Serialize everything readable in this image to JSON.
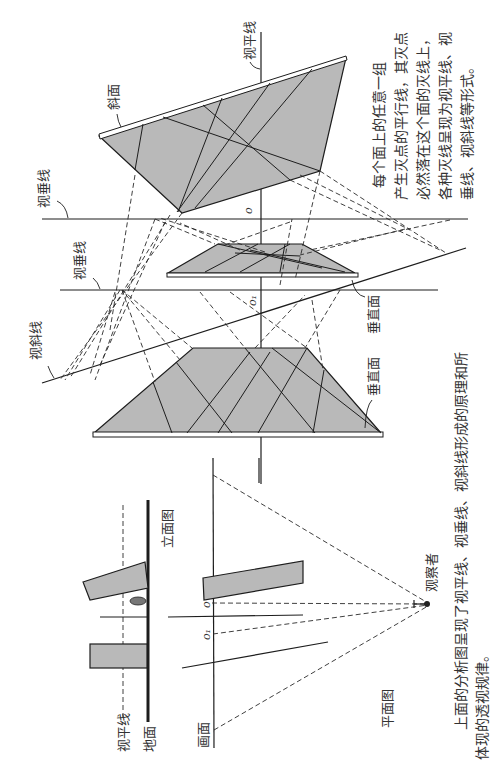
{
  "orientation": "rotated-90-ccw",
  "labels": {
    "horizon_line": "视平线",
    "vertical_line_top": "视垂线",
    "vertical_line_middle": "视垂线",
    "oblique_line": "视斜线",
    "inclined_plane": "斜面",
    "vertical_plane_middle": "垂直面",
    "vertical_plane_bottom": "垂直面",
    "point_o": "o",
    "point_o1": "o₁"
  },
  "plan_elevation": {
    "elevation_title": "立面图",
    "plan_title": "平面图",
    "horizon_line": "视平线",
    "ground": "地面",
    "picture_plane": "画面",
    "observer": "观察者",
    "point_o": "o",
    "point_o1": "o₁"
  },
  "side_note": {
    "lines": [
      "每个面上的任意一组",
      "产生灭点的平行线，其灭点",
      "必然落在这个面的灭线上，",
      "各种灭线呈现为视平线、视",
      "垂线、视斜线等形式。"
    ]
  },
  "caption": {
    "lines": [
      "上面的分析图呈现了视平线、视垂线、视斜线形成的原理和所",
      "体现的透视规律。"
    ]
  }
}
